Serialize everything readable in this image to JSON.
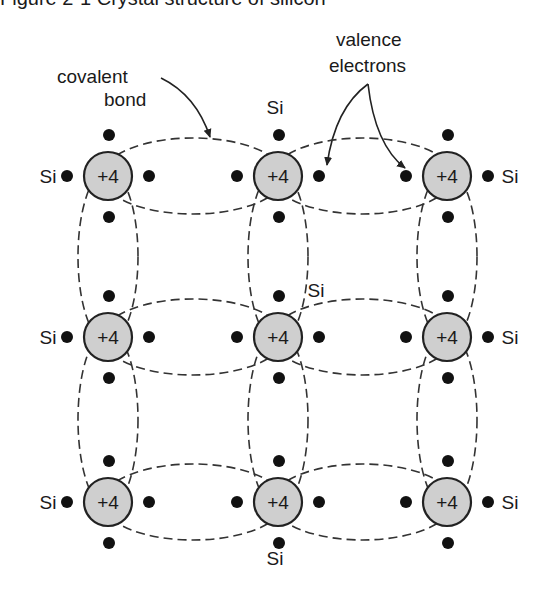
{
  "caption": "Figure 2-1  Crystal structure of silicon",
  "labels": {
    "covalent_bond_line1": "covalent",
    "covalent_bond_line2": "bond",
    "valence_electrons_line1": "valence",
    "valence_electrons_line2": "electrons",
    "si": "Si"
  },
  "atom": {
    "charge": "+4",
    "core_fill": "#cfcfcf",
    "radius": 24
  },
  "grid": {
    "columns_x": [
      108,
      278,
      447
    ],
    "rows_y": [
      176,
      337,
      502
    ],
    "electron_offset": 41,
    "electron_radius": 6
  },
  "neighbor_labels": [
    {
      "text": "Si",
      "x": 275,
      "y": 114,
      "position": "top-center"
    },
    {
      "text": "Si",
      "x": 48,
      "y": 183,
      "position": "row1-left"
    },
    {
      "text": "Si",
      "x": 510,
      "y": 183,
      "position": "row1-right"
    },
    {
      "text": "Si",
      "x": 48,
      "y": 344,
      "position": "row2-left"
    },
    {
      "text": "Si",
      "x": 316,
      "y": 297,
      "position": "center-annotation"
    },
    {
      "text": "Si",
      "x": 510,
      "y": 344,
      "position": "row2-right"
    },
    {
      "text": "Si",
      "x": 48,
      "y": 509,
      "position": "row3-left"
    },
    {
      "text": "Si",
      "x": 510,
      "y": 509,
      "position": "row3-right"
    },
    {
      "text": "Si",
      "x": 275,
      "y": 565,
      "position": "bottom-center"
    }
  ],
  "colors": {
    "ink": "#1a1a1a",
    "atom_fill": "#cfcfcf",
    "background": "#ffffff"
  }
}
